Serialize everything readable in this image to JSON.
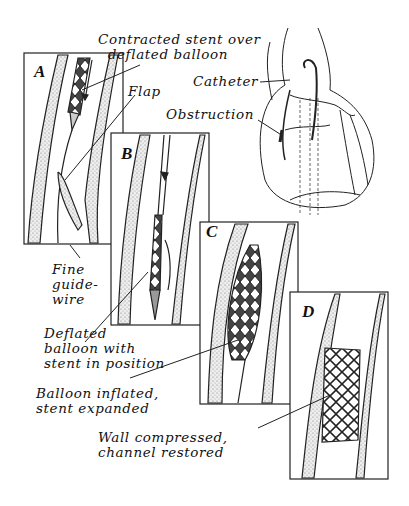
{
  "figure": {
    "panels": [
      {
        "id": "A",
        "letter": "A"
      },
      {
        "id": "B",
        "letter": "B"
      },
      {
        "id": "C",
        "letter": "C"
      },
      {
        "id": "D",
        "letter": "D"
      }
    ],
    "labels": {
      "contracted_stent": "Contracted stent over\n  deflated balloon",
      "flap": "Flap",
      "catheter": "Catheter",
      "obstruction": "Obstruction",
      "fine_guidewire": "Fine\nguide-\nwire",
      "deflated_balloon": "Deflated\nballoon with\nstent in position",
      "balloon_inflated": "Balloon inflated,\nstent expanded",
      "wall_compressed": "Wall compressed,\nchannel restored"
    },
    "colors": {
      "ink": "#111111",
      "vessel_fill": "#e4e4e4",
      "background": "#ffffff"
    }
  }
}
